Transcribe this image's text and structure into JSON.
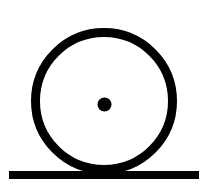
{
  "figure": {
    "name": "wheel-on-ground-diagram",
    "width": 209,
    "height": 194,
    "background_color": "#ffffff",
    "ink_color": "#000000"
  },
  "shapes": {
    "wheel_rim": {
      "label": "wheel-rim",
      "type": "circle-outline",
      "cx": 104,
      "cy": 101,
      "radius": 68.5,
      "stroke_width": 9,
      "stroke_color": "#000000",
      "fill": "none"
    },
    "hub_dot": {
      "label": "hub-center-dot",
      "type": "circle-filled",
      "cx": 104.5,
      "cy": 104.5,
      "radius": 7,
      "fill_color": "#000000"
    },
    "ground_line": {
      "label": "ground-line",
      "type": "rectangle",
      "x": 9,
      "y": 171,
      "width": 190,
      "height": 8,
      "fill_color": "#000000"
    }
  }
}
